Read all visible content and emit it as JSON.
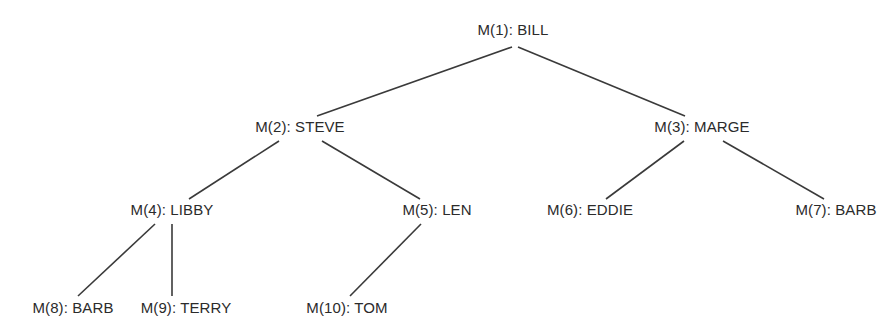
{
  "diagram": {
    "type": "tree",
    "title": "",
    "background_color": "#ffffff",
    "text_color": "#2b2b2b",
    "edge_color": "#3a3a3a",
    "edge_width": 1.6,
    "nodes": [
      {
        "id": "M1",
        "label": "M(1): BILL",
        "code": "M(1)",
        "name": "BILL",
        "x": 513,
        "y": 30,
        "level": 0
      },
      {
        "id": "M2",
        "label": "M(2): STEVE",
        "code": "M(2)",
        "name": "STEVE",
        "x": 300,
        "y": 127,
        "level": 1
      },
      {
        "id": "M3",
        "label": "M(3): MARGE",
        "code": "M(3)",
        "name": "MARGE",
        "x": 702,
        "y": 127,
        "level": 1
      },
      {
        "id": "M4",
        "label": "M(4): LIBBY",
        "code": "M(4)",
        "name": "LIBBY",
        "x": 172,
        "y": 210,
        "level": 2
      },
      {
        "id": "M5",
        "label": "M(5): LEN",
        "code": "M(5)",
        "name": "LEN",
        "x": 437,
        "y": 210,
        "level": 2
      },
      {
        "id": "M6",
        "label": "M(6): EDDIE",
        "code": "M(6)",
        "name": "EDDIE",
        "x": 590,
        "y": 210,
        "level": 2
      },
      {
        "id": "M7",
        "label": "M(7): BARB",
        "code": "M(7)",
        "name": "BARB",
        "x": 836,
        "y": 210,
        "level": 2
      },
      {
        "id": "M8",
        "label": "M(8): BARB",
        "code": "M(8)",
        "name": "BARB",
        "x": 73,
        "y": 308,
        "level": 3
      },
      {
        "id": "M9",
        "label": "M(9): TERRY",
        "code": "M(9)",
        "name": "TERRY",
        "x": 186,
        "y": 308,
        "level": 3
      },
      {
        "id": "M10",
        "label": "M(10): TOM",
        "code": "M(10)",
        "name": "TOM",
        "x": 347,
        "y": 308,
        "level": 3
      }
    ],
    "edges": [
      {
        "id": "e1",
        "from": "M1",
        "to": "M2",
        "x1": 512,
        "y1": 47,
        "x2": 317,
        "y2": 116
      },
      {
        "id": "e2",
        "from": "M1",
        "to": "M3",
        "x1": 518,
        "y1": 47,
        "x2": 685,
        "y2": 116
      },
      {
        "id": "e3",
        "from": "M2",
        "to": "M4",
        "x1": 279,
        "y1": 141,
        "x2": 189,
        "y2": 199
      },
      {
        "id": "e4",
        "from": "M2",
        "to": "M5",
        "x1": 322,
        "y1": 141,
        "x2": 420,
        "y2": 199
      },
      {
        "id": "e5",
        "from": "M3",
        "to": "M6",
        "x1": 684,
        "y1": 141,
        "x2": 606,
        "y2": 199
      },
      {
        "id": "e6",
        "from": "M3",
        "to": "M7",
        "x1": 723,
        "y1": 141,
        "x2": 824,
        "y2": 199
      },
      {
        "id": "e7",
        "from": "M4",
        "to": "M8",
        "x1": 155,
        "y1": 224,
        "x2": 78,
        "y2": 296
      },
      {
        "id": "e8",
        "from": "M4",
        "to": "M9",
        "x1": 172,
        "y1": 224,
        "x2": 172,
        "y2": 296
      },
      {
        "id": "e9",
        "from": "M5",
        "to": "M10",
        "x1": 421,
        "y1": 224,
        "x2": 350,
        "y2": 296
      }
    ]
  }
}
